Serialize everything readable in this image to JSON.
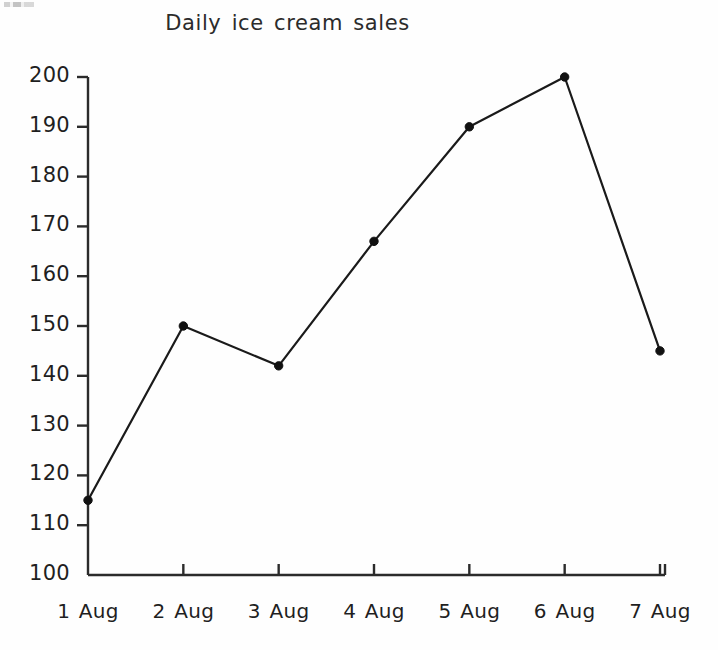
{
  "chart_data": {
    "type": "line",
    "title": "Daily ice cream sales",
    "xlabel": "",
    "ylabel": "",
    "categories": [
      "1 Aug",
      "2 Aug",
      "3 Aug",
      "4 Aug",
      "5 Aug",
      "6 Aug",
      "7 Aug"
    ],
    "values": [
      115,
      150,
      142,
      167,
      190,
      200,
      145
    ],
    "series": [
      {
        "name": "Daily ice cream sales",
        "values": [
          115,
          150,
          142,
          167,
          190,
          200,
          145
        ]
      }
    ],
    "ylim": [
      100,
      200
    ],
    "yticks": [
      100,
      110,
      120,
      130,
      140,
      150,
      160,
      170,
      180,
      190,
      200
    ],
    "ytick_labels": [
      "100",
      "110",
      "120",
      "130",
      "140",
      "150",
      "160",
      "170",
      "180",
      "190",
      "200"
    ],
    "xtick_labels": [
      "1 Aug",
      "2 Aug",
      "3 Aug",
      "4 Aug",
      "5 Aug",
      "6 Aug",
      "7 Aug"
    ],
    "grid": false,
    "legend": false,
    "legend_position": "none",
    "marker": "filled-circle",
    "line_color": "#1a1a1a",
    "marker_color": "#111111",
    "axis_color": "#2b2b2b",
    "background_color": "#fefefe"
  },
  "figure": {
    "title": "Daily ice cream sales",
    "axes": {
      "y_axis_name": "sales-axis",
      "x_axis_name": "date-axis"
    }
  }
}
